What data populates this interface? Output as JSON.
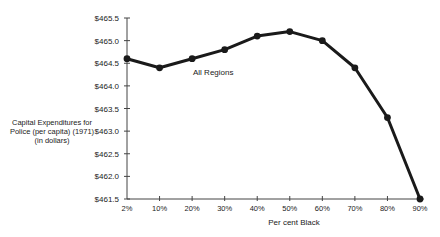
{
  "chart_data": {
    "type": "line",
    "title": "",
    "xlabel": "Per cent Black",
    "ylabel": "Capital Expenditures for Police (per capita) (1971) (in dollars)",
    "ylabel_lines": [
      "Capital Expenditures for",
      "Police (per capita) (1971)",
      "(in dollars)"
    ],
    "categories": [
      "2%",
      "10%",
      "20%",
      "30%",
      "40%",
      "50%",
      "60%",
      "70%",
      "80%",
      "90%"
    ],
    "series": [
      {
        "name": "All Regions",
        "values": [
          464.6,
          464.4,
          464.6,
          464.8,
          465.1,
          465.2,
          465.0,
          464.4,
          463.3,
          461.5
        ]
      }
    ],
    "annotations": [
      {
        "text": "All Regions",
        "near": "10%-20%"
      }
    ],
    "ylim": [
      461.5,
      465.5
    ],
    "yticks": [
      461.5,
      462.0,
      462.5,
      463.0,
      463.5,
      464.0,
      464.5,
      465.0,
      465.5
    ],
    "ytick_labels": [
      "$461.5",
      "$462.0",
      "$462.5",
      "$463.0",
      "$463.5",
      "$464.0",
      "$464.5",
      "$465.0",
      "$465.5"
    ],
    "grid": false,
    "legend": "none",
    "line_color": "#1a1a1a"
  }
}
